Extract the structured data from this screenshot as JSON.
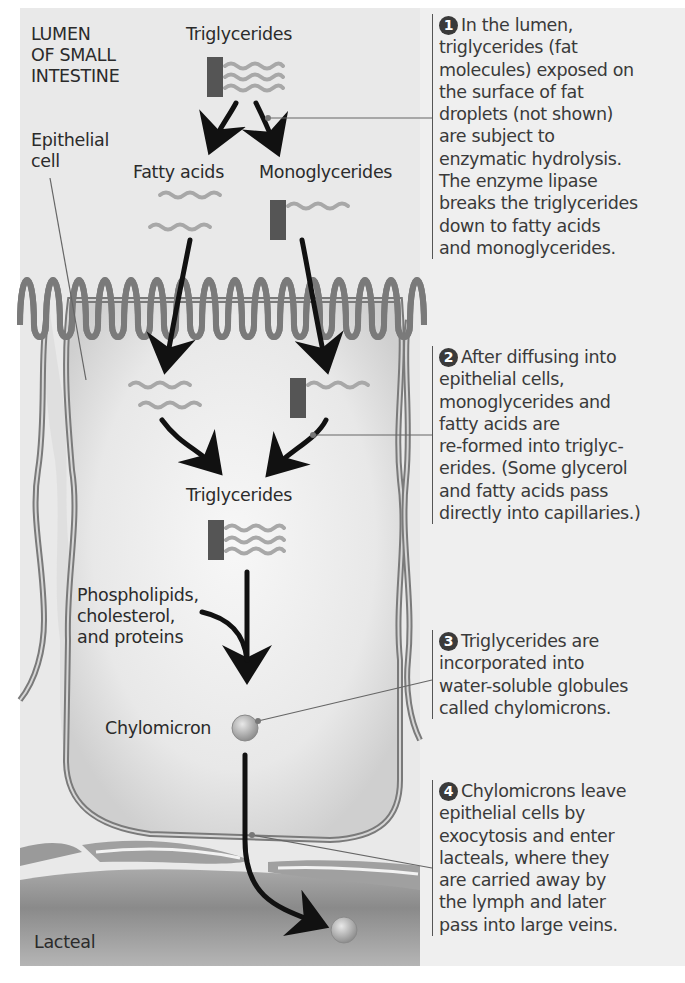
{
  "labels": {
    "lumen": [
      "LUMEN",
      "OF SMALL",
      "INTESTINE"
    ],
    "epithelial_cell": [
      "Epithelial",
      "cell"
    ],
    "triglycerides_top": "Triglycerides",
    "fatty_acids": "Fatty acids",
    "monoglycerides": "Monoglycerides",
    "triglycerides_mid": "Triglycerides",
    "phospholipids": [
      "Phospholipids,",
      "cholesterol,",
      "and proteins"
    ],
    "chylomicron": "Chylomicron",
    "lacteal": "Lacteal"
  },
  "steps": [
    {
      "number": "1",
      "lines": [
        "In the lumen,",
        "triglycerides (fat",
        "molecules) exposed on",
        "the surface of fat",
        "droplets (not shown)",
        "are subject to",
        "enzymatic hydrolysis.",
        "The enzyme lipase",
        "breaks the triglycerides",
        "down to fatty acids",
        "and monoglycerides."
      ]
    },
    {
      "number": "2",
      "lines": [
        "After diffusing into",
        "epithelial cells,",
        "monoglycerides and",
        "fatty acids are",
        "re-formed into triglyc-",
        "erides. (Some glycerol",
        "and fatty acids pass",
        "directly into capillaries.)"
      ]
    },
    {
      "number": "3",
      "lines": [
        "Triglycerides are",
        "incorporated into",
        "water-soluble globules",
        "called chylomicrons."
      ]
    },
    {
      "number": "4",
      "lines": [
        "Chylomicrons leave",
        "epithelial cells by",
        "exocytosis and enter",
        "lacteals, where they",
        "are carried away by",
        "the lymph and later",
        "pass into large veins."
      ]
    }
  ],
  "colors": {
    "background": "#e9e9e9",
    "glycerol_block": "#555555",
    "fatty_acid_chain": "#a8a8a8",
    "arrow": "#111111",
    "membrane": "#7a7a7a",
    "lacteal": "#8c8c8c",
    "badge": "#3a3a3a"
  }
}
